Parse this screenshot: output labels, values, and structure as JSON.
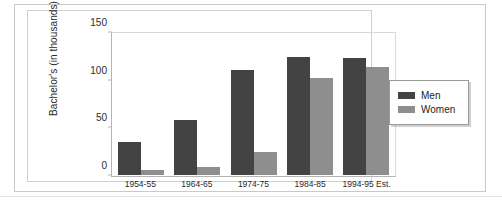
{
  "chart_data": {
    "type": "bar",
    "title": "",
    "xlabel": "",
    "ylabel": "Bachelor's (in thousands)",
    "categories": [
      "1954-55",
      "1964-65",
      "1974-75",
      "1984-85",
      "1994-95 Est."
    ],
    "series": [
      {
        "name": "Men",
        "color": "#434343",
        "values": [
          35,
          59,
          112,
          126,
          125
        ]
      },
      {
        "name": "Women",
        "color": "#8e8e8e",
        "values": [
          5,
          8,
          25,
          103,
          115
        ]
      }
    ],
    "ylim": [
      0,
      150
    ],
    "yticks": [
      0,
      50,
      100,
      150
    ],
    "ytick_labels": [
      "0",
      "50",
      "100",
      "150"
    ],
    "grid": false,
    "legend_position": "right",
    "legend_entries": [
      "Men",
      "Women"
    ]
  },
  "caption": {
    "text": ""
  }
}
